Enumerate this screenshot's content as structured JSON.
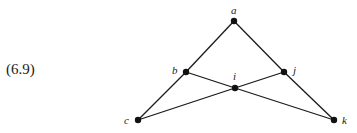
{
  "equation_label": "(6.9)",
  "graph": {
    "nodes": [
      {
        "id": "a",
        "label": "a",
        "x": 234,
        "y": 21,
        "lx": 231,
        "ly": 14
      },
      {
        "id": "b",
        "label": "b",
        "x": 186,
        "y": 72,
        "lx": 172,
        "ly": 74
      },
      {
        "id": "j",
        "label": "j",
        "x": 284,
        "y": 72,
        "lx": 293,
        "ly": 74
      },
      {
        "id": "i",
        "label": "i",
        "x": 235,
        "y": 88,
        "lx": 233,
        "ly": 80
      },
      {
        "id": "c",
        "label": "c",
        "x": 138,
        "y": 120,
        "lx": 124,
        "ly": 124
      },
      {
        "id": "k",
        "label": "k",
        "x": 334,
        "y": 120,
        "lx": 342,
        "ly": 124
      }
    ],
    "edges": [
      [
        "a",
        "b"
      ],
      [
        "a",
        "j"
      ],
      [
        "b",
        "c"
      ],
      [
        "j",
        "k"
      ],
      [
        "b",
        "i"
      ],
      [
        "i",
        "k"
      ],
      [
        "c",
        "i"
      ],
      [
        "i",
        "j"
      ]
    ]
  }
}
